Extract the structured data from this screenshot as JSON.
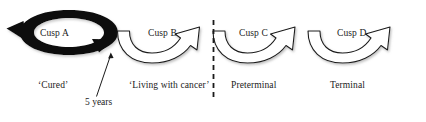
{
  "figure": {
    "colors": {
      "stroke": "#1a1a1a",
      "loop_fill": "#0d0d0d",
      "arrow_fill": "#ffffff",
      "background": "#ffffff"
    },
    "cusps": [
      {
        "id": "cusp-a",
        "label": "Cusp A",
        "shape": "black-circular-loop-arrow"
      },
      {
        "id": "cusp-b",
        "label": "Cusp B",
        "shape": "white-curved-arrow"
      },
      {
        "id": "cusp-c",
        "label": "Cusp C",
        "shape": "white-curved-arrow"
      },
      {
        "id": "cusp-d",
        "label": "Cusp D",
        "shape": "white-curved-arrow"
      }
    ],
    "phase_labels": [
      {
        "id": "cured",
        "text": "‘Cured’"
      },
      {
        "id": "living",
        "text": "‘Living with cancer’"
      },
      {
        "id": "preterminal",
        "text": "Preterminal"
      },
      {
        "id": "terminal",
        "text": "Terminal"
      }
    ],
    "annotations": [
      {
        "id": "five-years",
        "text": "5 years",
        "points_to": "cusp-a-exit-arrowhead"
      }
    ],
    "divider": {
      "id": "dashed-divider",
      "style": "vertical-dashed-line",
      "between": [
        "‘Living with cancer’",
        "Preterminal"
      ]
    }
  }
}
